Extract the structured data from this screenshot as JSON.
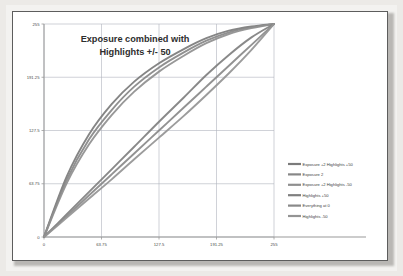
{
  "chart_data": {
    "type": "line",
    "title_line1": "Exposure combined with",
    "title_line2": "Highlights +/- 50",
    "xlabel": "",
    "ylabel": "",
    "xlim": [
      0,
      255
    ],
    "ylim": [
      0,
      255
    ],
    "xticks": [
      "0",
      "63.75",
      "127.5",
      "191.25",
      "255"
    ],
    "yticks": [
      "0",
      "63.75",
      "127.5",
      "191.25",
      "255"
    ],
    "xtick_values": [
      0,
      63.75,
      127.5,
      191.25,
      255
    ],
    "ytick_values": [
      0,
      63.75,
      127.5,
      191.25,
      255
    ],
    "grid": true,
    "legend_position": "right",
    "x": [
      0,
      25,
      50,
      75,
      100,
      127.5,
      155,
      180,
      205,
      230,
      255
    ],
    "series": [
      {
        "name": "Exposure +2 Highlights +50",
        "color": "#7b7b7b",
        "values": [
          0,
          72,
          123,
          159,
          186,
          208,
          225,
          238,
          247,
          252,
          255
        ]
      },
      {
        "name": "Exposure 2",
        "color": "#878787",
        "values": [
          0,
          68,
          117,
          152,
          180,
          203,
          221,
          235,
          245,
          251,
          255
        ]
      },
      {
        "name": "Exposure +2 Highlights -50",
        "color": "#8f8f8f",
        "values": [
          0,
          64,
          111,
          146,
          174,
          198,
          217,
          232,
          243,
          250,
          255
        ]
      },
      {
        "name": "Highlights +50",
        "color": "#7f7f7f",
        "values": [
          0,
          27,
          54,
          81,
          108,
          138,
          167,
          194,
          218,
          239,
          255
        ]
      },
      {
        "name": "Everything at 0",
        "color": "#898989",
        "values": [
          0,
          25,
          50,
          75,
          100,
          127.5,
          155,
          180,
          205,
          230,
          255
        ]
      },
      {
        "name": "Highlights -50",
        "color": "#949494",
        "values": [
          0,
          23,
          46,
          69,
          93,
          119,
          145,
          170,
          196,
          224,
          255
        ]
      }
    ]
  },
  "legend": {
    "entries": [
      "Exposure +2 Highlights +50",
      "Exposure 2",
      "Exposure +2 Highlights -50",
      "Highlights +50",
      "Everything at 0",
      "Highlights -50"
    ]
  },
  "style": {
    "grid_color": "#b0b4bd",
    "axis_color": "#9a9a9a",
    "frame_color": "#5d5d5d",
    "page_background": "#ffffff"
  }
}
